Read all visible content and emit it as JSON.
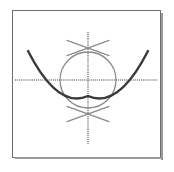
{
  "figure": {
    "title": "Circle and parabola with coordinate axes",
    "frame": {
      "border_color": "#6d6d6d",
      "shadow_color": "#9a9a9a",
      "background_color": "#ffffff"
    },
    "colors": {
      "axis": "#808080",
      "circle": "#8a8a8a",
      "parabola": "#3a3a3a",
      "cross_mark": "#8a8a8a"
    }
  },
  "chart_data": {
    "type": "scatter",
    "title": "Circle and parabola with coordinate axes",
    "xlabel": "",
    "ylabel": "",
    "xlim": [
      -5,
      5
    ],
    "ylim": [
      -5,
      5
    ],
    "grid": false,
    "legend": "none",
    "axes": {
      "x_axis": {
        "name": "horizontal-axis",
        "style": "dotted",
        "color": "#808080",
        "from": [
          3,
          70
        ],
        "to": [
          146,
          70
        ]
      },
      "y_axis": {
        "name": "vertical-axis",
        "style": "dotted",
        "color": "#808080",
        "from": [
          76,
          22
        ],
        "to": [
          76,
          134
        ]
      }
    },
    "curves": [
      {
        "name": "circle",
        "kind": "circle",
        "center": [
          76,
          70
        ],
        "radius": 28,
        "color": "#8a8a8a",
        "line_width": 1.3
      },
      {
        "name": "parabola",
        "kind": "parabola",
        "vertex": [
          76,
          86
        ],
        "opens": "up",
        "color": "#3a3a3a",
        "line_width": 2.4,
        "x_axis_roots": [
          51,
          101
        ],
        "endpoints": [
          [
            16,
            41
          ],
          [
            136,
            41
          ]
        ]
      }
    ],
    "annotations": [
      {
        "name": "top-cross-mark",
        "kind": "x-cross",
        "center": [
          76,
          38
        ],
        "arm_length": 21,
        "color": "#8a8a8a"
      },
      {
        "name": "bottom-cross-mark",
        "kind": "x-cross",
        "center": [
          76,
          104
        ],
        "arm_length": 21,
        "color": "#8a8a8a"
      }
    ]
  }
}
